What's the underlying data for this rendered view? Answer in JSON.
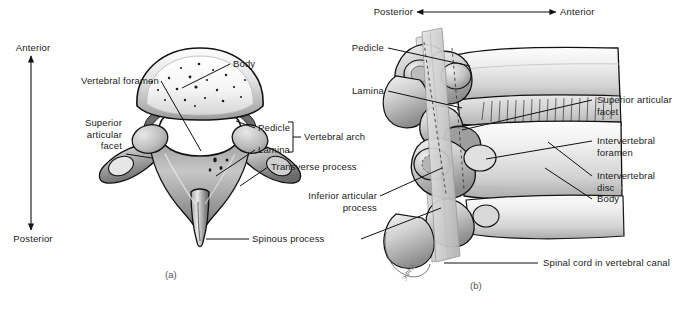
{
  "figure": {
    "background_color": "#ffffff",
    "line_color": "#000000",
    "text_color": "#1a1a1a"
  },
  "orientation": {
    "left_axis": {
      "top_label": "Anterior",
      "bottom_label": "Posterior",
      "direction": "vertical-double-arrow"
    },
    "top_axis": {
      "left_label": "Posterior",
      "right_label": "Anterior",
      "direction": "horizontal-double-arrow"
    }
  },
  "panel_a": {
    "id": "(a)",
    "view": "superior view of a cervical vertebra",
    "labels": [
      {
        "key": "body",
        "text": "Body"
      },
      {
        "key": "vertebral_foramen",
        "text": "Vertebral foramen"
      },
      {
        "key": "superior_articular_facet",
        "text": "Superior\narticular\nfacet"
      },
      {
        "key": "pedicle",
        "text": "Pedicle"
      },
      {
        "key": "lamina",
        "text": "Lamina"
      },
      {
        "key": "vertebral_arch",
        "text": "Vertebral arch"
      },
      {
        "key": "transverse_process",
        "text": "Transverse process"
      },
      {
        "key": "spinous_process",
        "text": "Spinous process"
      }
    ]
  },
  "panel_b": {
    "id": "(b)",
    "view": "lateral view of articulated vertebrae",
    "artist_signature": "ЭФНК",
    "labels": [
      {
        "key": "pedicle",
        "text": "Pedicle"
      },
      {
        "key": "lamina",
        "text": "Lamina"
      },
      {
        "key": "superior_articular_facet",
        "text": "Superior articular\nfacet"
      },
      {
        "key": "intervertebral_foramen",
        "text": "Intervertebral\nforamen"
      },
      {
        "key": "intervertebral_disc",
        "text": "Intervertebral\ndisc"
      },
      {
        "key": "body",
        "text": "Body"
      },
      {
        "key": "inferior_articular_process",
        "text": "Inferior articular\nprocess"
      },
      {
        "key": "spinal_cord",
        "text": "Spinal cord in vertebral canal"
      }
    ]
  },
  "colors": {
    "bone_light": "#f2f2f2",
    "bone_mid": "#c9c9c9",
    "bone_dark": "#8a8a8a",
    "bone_shadow": "#5a5a5a",
    "cord_gray": "#cdcdcd",
    "outline": "#111111"
  }
}
